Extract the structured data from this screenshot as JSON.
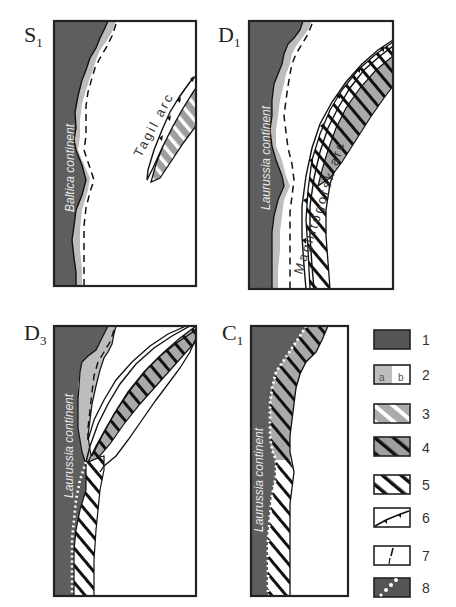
{
  "colors": {
    "continent": "#5e5e5e",
    "margin_shelf": "#bdbdbd",
    "outline": "#222222",
    "background": "#ffffff"
  },
  "panels": [
    {
      "id": "S",
      "sub": "1",
      "continent_label": "Baltica continent",
      "arc_label": "Tagil arc"
    },
    {
      "id": "D",
      "sub": "1",
      "continent_label": "Laurussia continent",
      "arc_label": "Magnitogorsk arc"
    },
    {
      "id": "D",
      "sub": "3",
      "continent_label": "Laurussia continent",
      "arc_label": ""
    },
    {
      "id": "C",
      "sub": "1",
      "continent_label": "Laurussia continent",
      "arc_label": ""
    }
  ],
  "legend": {
    "items": [
      {
        "num": "1",
        "symbol": "dark-gray-fill"
      },
      {
        "num": "2",
        "symbol": "split-a-gray-b-white",
        "a": "a",
        "b": "b"
      },
      {
        "num": "3",
        "symbol": "gray-with-white-hatch"
      },
      {
        "num": "4",
        "symbol": "gray-with-black-hatch"
      },
      {
        "num": "5",
        "symbol": "white-with-black-hatch"
      },
      {
        "num": "6",
        "symbol": "barbed-line"
      },
      {
        "num": "7",
        "symbol": "fault-tick"
      },
      {
        "num": "8",
        "symbol": "dark-with-white-dots"
      }
    ]
  }
}
